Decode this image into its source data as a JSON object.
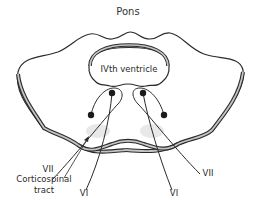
{
  "title": "Pons",
  "labels": {
    "ventricle": "IVth ventricle",
    "vii_left": "VII",
    "vii_right": "VII",
    "corticospinal_line1": "Corticospinal",
    "corticospinal_line2": "tract",
    "vi_left": "VI",
    "vi_right": "VI"
  },
  "colors": {
    "outline": "#2b2b2b",
    "band_fill": "#bdbdbd",
    "nucleus": "#1a1a1a",
    "tract_blob": "#e6e6e6",
    "text": "#2a2a2a"
  }
}
